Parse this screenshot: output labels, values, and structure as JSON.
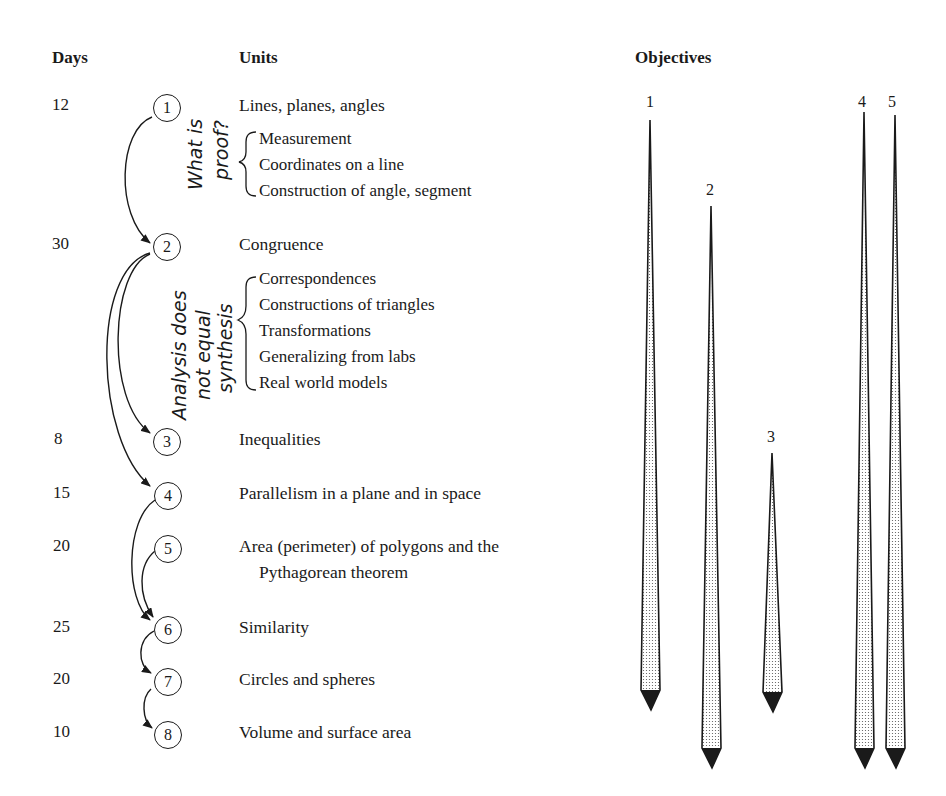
{
  "headers": {
    "days": "Days",
    "units": "Units",
    "objectives": "Objectives"
  },
  "units": [
    {
      "n": "1",
      "days": "12",
      "title": "Lines, planes, angles"
    },
    {
      "n": "2",
      "days": "30",
      "title": "Congruence"
    },
    {
      "n": "3",
      "days": "8",
      "title": "Inequalities"
    },
    {
      "n": "4",
      "days": "15",
      "title": "Parallelism in a plane and in space"
    },
    {
      "n": "5",
      "days": "20",
      "title": "Area (perimeter) of polygons and the",
      "title_line2": "Pythagorean theorem"
    },
    {
      "n": "6",
      "days": "25",
      "title": "Similarity"
    },
    {
      "n": "7",
      "days": "20",
      "title": "Circles and spheres"
    },
    {
      "n": "8",
      "days": "10",
      "title": "Volume and surface area"
    }
  ],
  "unit1_subtopics": [
    "Measurement",
    "Coordinates on a line",
    "Construction of angle, segment"
  ],
  "unit2_subtopics": [
    "Correspondences",
    "Constructions of triangles",
    "Transformations",
    "Generalizing from labs",
    "Real world models"
  ],
  "annotations": {
    "unit1_note_line1": "What is",
    "unit1_note_line2": "proof?",
    "unit2_note_line1": "Analysis does",
    "unit2_note_line2": "not  equal",
    "unit2_note_line3": "synthesis"
  },
  "dependencies": [
    {
      "from": "1",
      "to": "2"
    },
    {
      "from": "2",
      "to": "3"
    },
    {
      "from": "2",
      "to": "4"
    },
    {
      "from": "4",
      "to": "6"
    },
    {
      "from": "5",
      "to": "6"
    },
    {
      "from": "6",
      "to": "7"
    },
    {
      "from": "7",
      "to": "8"
    }
  ],
  "objectives": [
    {
      "label": "1",
      "start_unit": "1",
      "end_unit": "7"
    },
    {
      "label": "2",
      "start_unit": "1",
      "end_unit": "8"
    },
    {
      "label": "3",
      "start_unit": "3",
      "end_unit": "7"
    },
    {
      "label": "4",
      "start_unit": "1",
      "end_unit": "8"
    },
    {
      "label": "5",
      "start_unit": "1",
      "end_unit": "8"
    }
  ]
}
